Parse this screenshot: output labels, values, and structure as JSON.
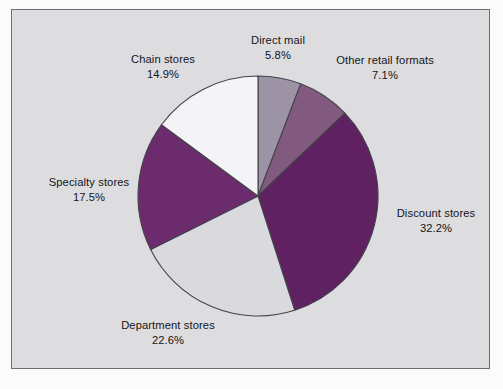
{
  "figure": {
    "background_color": "#fbfbfc",
    "frame_fill": "#dddde0",
    "frame_border_color": "#6e6e72",
    "label_text_color": "#141418",
    "slice_outline_color": "#43434a"
  },
  "chart_data": {
    "type": "pie",
    "title": "",
    "subtitle": "",
    "xlabel": "",
    "ylabel": "",
    "legend_position": "none",
    "grid": false,
    "units": "percent",
    "start_angle_deg": 0,
    "direction": "clockwise",
    "total": 100.1,
    "categories": [
      "Direct mail",
      "Other retail formats",
      "Discount stores",
      "Department stores",
      "Specialty stores",
      "Chain stores"
    ],
    "values": [
      5.8,
      7.1,
      32.2,
      22.6,
      17.5,
      14.9
    ],
    "slices": [
      {
        "label": "Direct mail",
        "value": 5.8,
        "value_text": "5.8%",
        "color": "#9d93a6",
        "label_position": "top-center"
      },
      {
        "label": "Other retail formats",
        "value": 7.1,
        "value_text": "7.1%",
        "color": "#82597f",
        "label_position": "top-right"
      },
      {
        "label": "Discount stores",
        "value": 32.2,
        "value_text": "32.2%",
        "color": "#5f2161",
        "label_position": "right"
      },
      {
        "label": "Department stores",
        "value": 22.6,
        "value_text": "22.6%",
        "color": "#d9d9de",
        "label_position": "bottom-left"
      },
      {
        "label": "Specialty stores",
        "value": 17.5,
        "value_text": "17.5%",
        "color": "#6c2b6d",
        "label_position": "left"
      },
      {
        "label": "Chain stores",
        "value": 14.9,
        "value_text": "14.9%",
        "color": "#f4f4f6",
        "label_position": "top-left"
      }
    ]
  }
}
